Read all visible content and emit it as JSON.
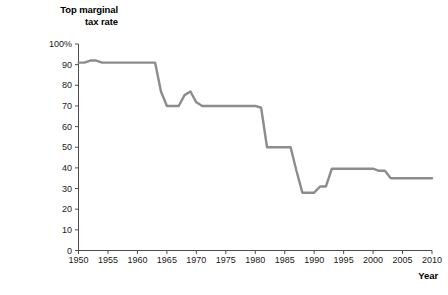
{
  "chart_data": {
    "type": "line",
    "title": "",
    "xlabel": "Year",
    "ylabel": "Top marginal\ntax rate",
    "ylabel_lines": [
      "Top marginal",
      "tax rate"
    ],
    "xlim": [
      1950,
      2010
    ],
    "ylim": [
      0,
      100
    ],
    "grid": false,
    "legend": null,
    "y_tick_labels": [
      "100%",
      "90",
      "80",
      "70",
      "60",
      "50",
      "40",
      "30",
      "20",
      "10",
      "0"
    ],
    "y_ticks": [
      100,
      90,
      80,
      70,
      60,
      50,
      40,
      30,
      20,
      10,
      0
    ],
    "x_tick_labels": [
      "1950",
      "1955",
      "1960",
      "1965",
      "1970",
      "1975",
      "1980",
      "1985",
      "1990",
      "1995",
      "2000",
      "2005",
      "2010"
    ],
    "x_ticks": [
      1950,
      1955,
      1960,
      1965,
      1970,
      1975,
      1980,
      1985,
      1990,
      1995,
      2000,
      2005,
      2010
    ],
    "series": [
      {
        "name": "Top marginal tax rate",
        "color": "#8c8c8c",
        "x": [
          1950,
          1951,
          1952,
          1953,
          1954,
          1955,
          1956,
          1957,
          1958,
          1959,
          1960,
          1961,
          1962,
          1963,
          1964,
          1965,
          1966,
          1967,
          1968,
          1969,
          1970,
          1971,
          1972,
          1973,
          1974,
          1975,
          1976,
          1977,
          1978,
          1979,
          1980,
          1981,
          1982,
          1983,
          1984,
          1985,
          1986,
          1987,
          1988,
          1989,
          1990,
          1991,
          1992,
          1993,
          1994,
          1995,
          1996,
          1997,
          1998,
          1999,
          2000,
          2001,
          2002,
          2003,
          2004,
          2005,
          2006,
          2007,
          2008,
          2009,
          2010
        ],
        "values": [
          91,
          91,
          92,
          92,
          91,
          91,
          91,
          91,
          91,
          91,
          91,
          91,
          91,
          91,
          77,
          70,
          70,
          70,
          75.25,
          77,
          71.75,
          70,
          70,
          70,
          70,
          70,
          70,
          70,
          70,
          70,
          70,
          69.125,
          50,
          50,
          50,
          50,
          50,
          38.5,
          28,
          28,
          28,
          31,
          31,
          39.6,
          39.6,
          39.6,
          39.6,
          39.6,
          39.6,
          39.6,
          39.6,
          38.6,
          38.6,
          35,
          35,
          35,
          35,
          35,
          35,
          35,
          35
        ]
      }
    ],
    "annotations": []
  },
  "axes": {
    "y_title_line1": "Top marginal",
    "y_title_line2": "tax rate",
    "x_title": "Year"
  },
  "style": {
    "line_color": "#8c8c8c",
    "axis_color": "#4d4d4d",
    "text_color": "#1a1a1a",
    "background": "#ffffff"
  }
}
